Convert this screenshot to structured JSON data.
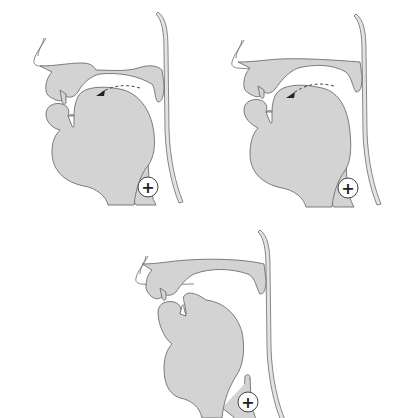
{
  "figure": {
    "panels": [
      {
        "id": "panel-1",
        "arrow": true,
        "glottis_marker": "+"
      },
      {
        "id": "panel-2",
        "arrow": true,
        "glottis_marker": "+"
      },
      {
        "id": "panel-3",
        "arrow": false,
        "glottis_marker": "+"
      }
    ]
  },
  "colors": {
    "tissue": "#d3d3d3",
    "outline": "#6e6e6e",
    "background": "#ffffff"
  }
}
